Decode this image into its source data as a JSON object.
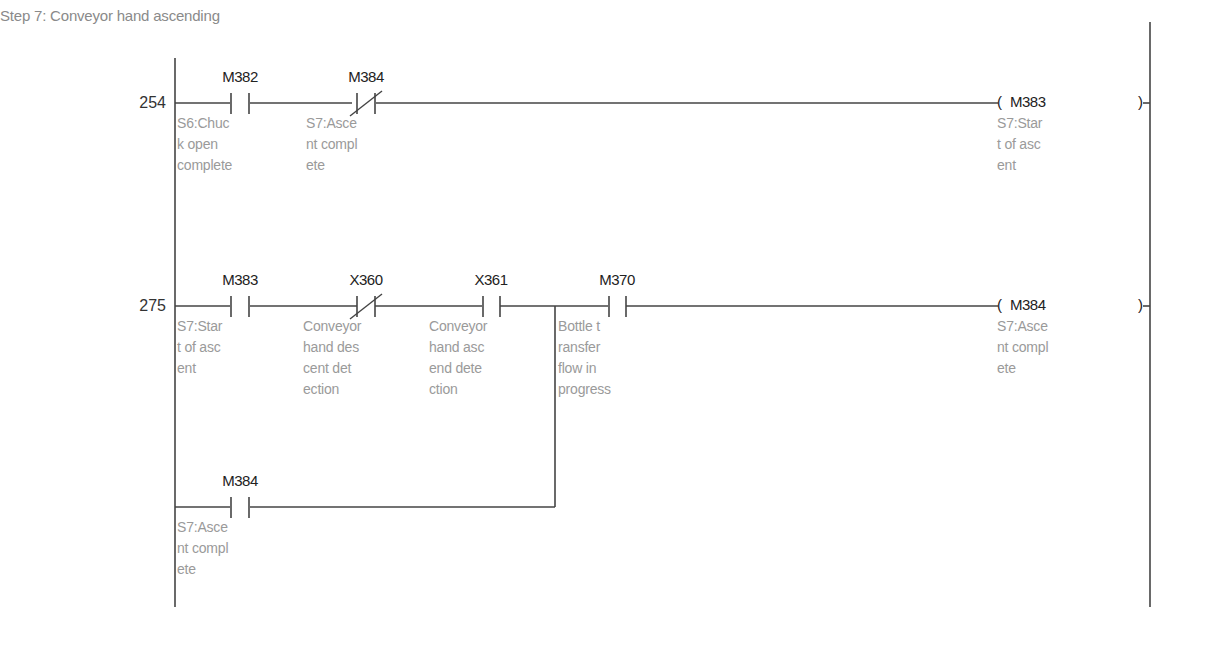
{
  "diagram": {
    "title": "Step 7: Conveyor hand ascending",
    "rungs": [
      {
        "step": "254",
        "contacts": [
          {
            "device": "M382",
            "type": "normally-open",
            "comment": "S6:Chuc\nk open\ncomplete"
          },
          {
            "device": "M384",
            "type": "normally-closed",
            "comment": "S7:Asce\nnt compl\nete"
          }
        ],
        "coil": {
          "device": "M383",
          "comment": "S7:Star\nt of asc\nent",
          "open": "(",
          "close": ")"
        }
      },
      {
        "step": "275",
        "contacts": [
          {
            "device": "M383",
            "type": "normally-open",
            "comment": "S7:Star\nt of asc\nent"
          },
          {
            "device": "X360",
            "type": "normally-closed",
            "comment": "Conveyor\nhand des\ncent det\nection"
          },
          {
            "device": "X361",
            "type": "normally-open",
            "comment": "Conveyor\nhand asc\nend dete\nction"
          },
          {
            "device": "M370",
            "type": "normally-open",
            "comment": "Bottle t\nransfer\nflow in\nprogress"
          }
        ],
        "parallel_branch": [
          {
            "device": "M384",
            "type": "normally-open",
            "comment": "S7:Asce\nnt compl\nete"
          }
        ],
        "coil": {
          "device": "M384",
          "comment": "S7:Asce\nnt compl\nete",
          "open": "(",
          "close": ")"
        }
      }
    ]
  },
  "colors": {
    "line": "#444444",
    "device_text": "#222222",
    "comment_text": "#9a9a9a",
    "title_text": "#8a8a8a"
  }
}
